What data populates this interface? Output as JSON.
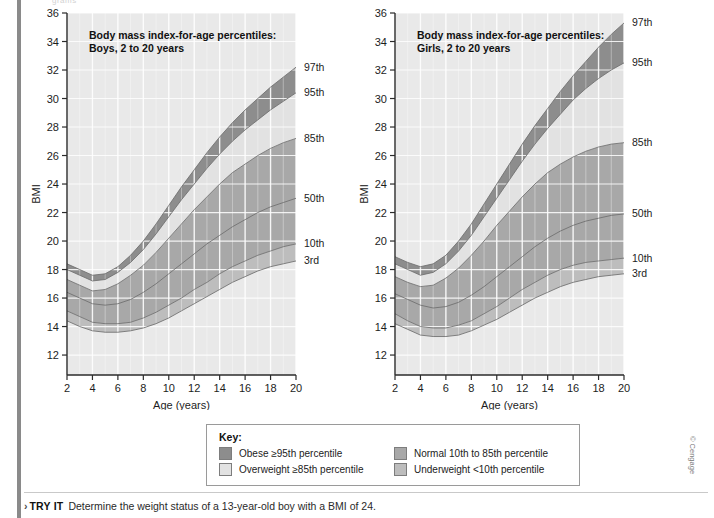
{
  "page": {
    "faint_top_text": "grams",
    "credit": "© Cengage"
  },
  "colors": {
    "obese": "#8d8d8d",
    "overweight": "#e2e2e2",
    "normal": "#a8a8a8",
    "underweight": "#bdbdbd",
    "plot_bg": "#e9e9e9",
    "grid": "#ffffff",
    "axis": "#2b2b2b",
    "curve": "#6e6e6e"
  },
  "charts": [
    {
      "id": "boys",
      "title_line1": "Body mass index-for-age percentiles:",
      "title_line2": "Boys, 2 to 20 years",
      "xlabel": "Age (years)",
      "ylabel": "BMI",
      "xticks": [
        2,
        4,
        6,
        8,
        10,
        12,
        14,
        16,
        18,
        20
      ],
      "yticks": [
        12,
        14,
        16,
        18,
        20,
        22,
        24,
        26,
        28,
        30,
        32,
        34,
        36
      ],
      "xlim": [
        2,
        20
      ],
      "ylim": [
        10.6,
        36
      ],
      "percentile_labels": [
        "97th",
        "95th",
        "85th",
        "50th",
        "10th",
        "3rd"
      ],
      "series": [
        {
          "name": "97th",
          "values": [
            18.4,
            18.0,
            17.6,
            17.7,
            18.2,
            19.0,
            20.0,
            21.2,
            22.5,
            23.8,
            25.0,
            26.2,
            27.3,
            28.3,
            29.2,
            30.0,
            30.8,
            31.5,
            32.2
          ]
        },
        {
          "name": "95th",
          "values": [
            18.0,
            17.6,
            17.2,
            17.3,
            17.8,
            18.5,
            19.4,
            20.5,
            21.7,
            22.9,
            24.0,
            25.1,
            26.1,
            27.0,
            27.8,
            28.5,
            29.2,
            29.8,
            30.4
          ]
        },
        {
          "name": "85th",
          "values": [
            17.3,
            16.9,
            16.5,
            16.6,
            17.0,
            17.6,
            18.3,
            19.2,
            20.2,
            21.2,
            22.2,
            23.1,
            24.0,
            24.8,
            25.4,
            26.0,
            26.5,
            26.9,
            27.2
          ]
        },
        {
          "name": "50th",
          "values": [
            16.4,
            16.0,
            15.6,
            15.5,
            15.6,
            15.9,
            16.4,
            17.0,
            17.7,
            18.4,
            19.1,
            19.8,
            20.4,
            21.0,
            21.5,
            22.0,
            22.4,
            22.7,
            23.0
          ]
        },
        {
          "name": "10th",
          "values": [
            15.1,
            14.7,
            14.3,
            14.2,
            14.2,
            14.3,
            14.6,
            15.0,
            15.5,
            16.0,
            16.6,
            17.1,
            17.7,
            18.2,
            18.6,
            19.0,
            19.3,
            19.6,
            19.8
          ]
        },
        {
          "name": "3rd",
          "values": [
            14.4,
            14.0,
            13.7,
            13.6,
            13.6,
            13.7,
            13.9,
            14.2,
            14.6,
            15.1,
            15.6,
            16.1,
            16.6,
            17.1,
            17.5,
            17.9,
            18.2,
            18.4,
            18.6
          ]
        }
      ]
    },
    {
      "id": "girls",
      "title_line1": "Body mass index-for-age percentiles:",
      "title_line2": "Girls, 2 to 20 years",
      "xlabel": "Age (years)",
      "ylabel": "BMI",
      "xticks": [
        2,
        4,
        6,
        8,
        10,
        12,
        14,
        16,
        18,
        20
      ],
      "yticks": [
        12,
        14,
        16,
        18,
        20,
        22,
        24,
        26,
        28,
        30,
        32,
        34,
        36
      ],
      "xlim": [
        2,
        20
      ],
      "ylim": [
        10.6,
        36
      ],
      "percentile_labels": [
        "97th",
        "95th",
        "85th",
        "50th",
        "10th",
        "3rd"
      ],
      "series": [
        {
          "name": "97th",
          "values": [
            18.9,
            18.5,
            18.2,
            18.4,
            19.0,
            20.0,
            21.2,
            22.6,
            24.0,
            25.4,
            26.8,
            28.1,
            29.3,
            30.5,
            31.6,
            32.6,
            33.6,
            34.5,
            35.3
          ]
        },
        {
          "name": "95th",
          "values": [
            18.4,
            18.0,
            17.6,
            17.8,
            18.4,
            19.3,
            20.4,
            21.7,
            23.0,
            24.3,
            25.6,
            26.8,
            27.9,
            28.9,
            29.9,
            30.7,
            31.4,
            32.0,
            32.5
          ]
        },
        {
          "name": "85th",
          "values": [
            17.5,
            17.1,
            16.8,
            16.9,
            17.4,
            18.1,
            19.0,
            20.0,
            21.1,
            22.1,
            23.1,
            24.0,
            24.8,
            25.4,
            25.9,
            26.3,
            26.6,
            26.8,
            26.9
          ]
        },
        {
          "name": "50th",
          "values": [
            16.3,
            15.9,
            15.5,
            15.3,
            15.4,
            15.7,
            16.2,
            16.8,
            17.5,
            18.2,
            18.9,
            19.6,
            20.2,
            20.7,
            21.1,
            21.4,
            21.6,
            21.8,
            21.9
          ]
        },
        {
          "name": "10th",
          "values": [
            14.9,
            14.4,
            14.0,
            13.9,
            13.9,
            14.1,
            14.4,
            14.9,
            15.4,
            16.0,
            16.6,
            17.1,
            17.6,
            18.0,
            18.3,
            18.5,
            18.6,
            18.7,
            18.8
          ]
        },
        {
          "name": "3rd",
          "values": [
            14.2,
            13.8,
            13.4,
            13.3,
            13.3,
            13.4,
            13.7,
            14.1,
            14.5,
            15.0,
            15.5,
            16.0,
            16.4,
            16.8,
            17.1,
            17.3,
            17.5,
            17.6,
            17.7
          ]
        }
      ]
    }
  ],
  "key": {
    "title": "Key:",
    "items": [
      {
        "label": "Obese ≥95th percentile",
        "color": "#8d8d8d"
      },
      {
        "label": "Normal 10th to 85th percentile",
        "color": "#a8a8a8"
      },
      {
        "label": "Overweight ≥85th percentile",
        "color": "#e2e2e2"
      },
      {
        "label": "Underweight <10th percentile",
        "color": "#bdbdbd"
      }
    ]
  },
  "try_it": {
    "chevron": "›",
    "label": "TRY IT",
    "text": "Determine the weight status of a 13-year-old boy with a BMI of 24."
  },
  "chart_data": {
    "type": "line",
    "title": "Body mass index-for-age percentiles",
    "xlabel": "Age (years)",
    "ylabel": "BMI",
    "x": [
      2,
      3,
      4,
      5,
      6,
      7,
      8,
      9,
      10,
      11,
      12,
      13,
      14,
      15,
      16,
      17,
      18,
      19,
      20
    ],
    "xlim": [
      2,
      20
    ],
    "ylim": [
      10.6,
      36
    ],
    "grid": true,
    "legend": "right-of-axis labels",
    "panels": [
      {
        "name": "Boys, 2 to 20 years",
        "series": [
          {
            "name": "97th",
            "values": [
              18.4,
              18.0,
              17.6,
              17.7,
              18.2,
              19.0,
              20.0,
              21.2,
              22.5,
              23.8,
              25.0,
              26.2,
              27.3,
              28.3,
              29.2,
              30.0,
              30.8,
              31.5,
              32.2
            ]
          },
          {
            "name": "95th",
            "values": [
              18.0,
              17.6,
              17.2,
              17.3,
              17.8,
              18.5,
              19.4,
              20.5,
              21.7,
              22.9,
              24.0,
              25.1,
              26.1,
              27.0,
              27.8,
              28.5,
              29.2,
              29.8,
              30.4
            ]
          },
          {
            "name": "85th",
            "values": [
              17.3,
              16.9,
              16.5,
              16.6,
              17.0,
              17.6,
              18.3,
              19.2,
              20.2,
              21.2,
              22.2,
              23.1,
              24.0,
              24.8,
              25.4,
              26.0,
              26.5,
              26.9,
              27.2
            ]
          },
          {
            "name": "50th",
            "values": [
              16.4,
              16.0,
              15.6,
              15.5,
              15.6,
              15.9,
              16.4,
              17.0,
              17.7,
              18.4,
              19.1,
              19.8,
              20.4,
              21.0,
              21.5,
              22.0,
              22.4,
              22.7,
              23.0
            ]
          },
          {
            "name": "10th",
            "values": [
              15.1,
              14.7,
              14.3,
              14.2,
              14.2,
              14.3,
              14.6,
              15.0,
              15.5,
              16.0,
              16.6,
              17.1,
              17.7,
              18.2,
              18.6,
              19.0,
              19.3,
              19.6,
              19.8
            ]
          },
          {
            "name": "3rd",
            "values": [
              14.4,
              14.0,
              13.7,
              13.6,
              13.6,
              13.7,
              13.9,
              14.2,
              14.6,
              15.1,
              15.6,
              16.1,
              16.6,
              17.1,
              17.5,
              17.9,
              18.2,
              18.4,
              18.6
            ]
          }
        ]
      },
      {
        "name": "Girls, 2 to 20 years",
        "series": [
          {
            "name": "97th",
            "values": [
              18.9,
              18.5,
              18.2,
              18.4,
              19.0,
              20.0,
              21.2,
              22.6,
              24.0,
              25.4,
              26.8,
              28.1,
              29.3,
              30.5,
              31.6,
              32.6,
              33.6,
              34.5,
              35.3
            ]
          },
          {
            "name": "95th",
            "values": [
              18.4,
              18.0,
              17.6,
              17.8,
              18.4,
              19.3,
              20.4,
              21.7,
              23.0,
              24.3,
              25.6,
              26.8,
              27.9,
              28.9,
              29.9,
              30.7,
              31.4,
              32.0,
              32.5
            ]
          },
          {
            "name": "85th",
            "values": [
              17.5,
              17.1,
              16.8,
              16.9,
              17.4,
              18.1,
              19.0,
              20.0,
              21.1,
              22.1,
              23.1,
              24.0,
              24.8,
              25.4,
              25.9,
              26.3,
              26.6,
              26.8,
              26.9
            ]
          },
          {
            "name": "50th",
            "values": [
              16.3,
              15.9,
              15.5,
              15.3,
              15.4,
              15.7,
              16.2,
              16.8,
              17.5,
              18.2,
              18.9,
              19.6,
              20.2,
              20.7,
              21.1,
              21.4,
              21.6,
              21.8,
              21.9
            ]
          },
          {
            "name": "10th",
            "values": [
              14.9,
              14.4,
              14.0,
              13.9,
              13.9,
              14.1,
              14.4,
              14.9,
              15.4,
              16.0,
              16.6,
              17.1,
              17.6,
              18.0,
              18.3,
              18.5,
              18.6,
              18.7,
              18.8
            ]
          },
          {
            "name": "3rd",
            "values": [
              14.2,
              13.8,
              13.4,
              13.3,
              13.3,
              13.4,
              13.7,
              14.1,
              14.5,
              15.0,
              15.5,
              16.0,
              16.4,
              16.8,
              17.1,
              17.3,
              17.5,
              17.6,
              17.7
            ]
          }
        ]
      }
    ],
    "bands": [
      {
        "label": "Obese ≥95th percentile",
        "between": [
          "95th",
          "97th+"
        ],
        "color": "#8d8d8d"
      },
      {
        "label": "Overweight ≥85th percentile",
        "between": [
          "85th",
          "95th"
        ],
        "color": "#e2e2e2"
      },
      {
        "label": "Normal 10th to 85th percentile",
        "between": [
          "10th",
          "85th"
        ],
        "color": "#a8a8a8"
      },
      {
        "label": "Underweight <10th percentile",
        "between": [
          "3rd",
          "10th"
        ],
        "color": "#bdbdbd"
      }
    ]
  }
}
